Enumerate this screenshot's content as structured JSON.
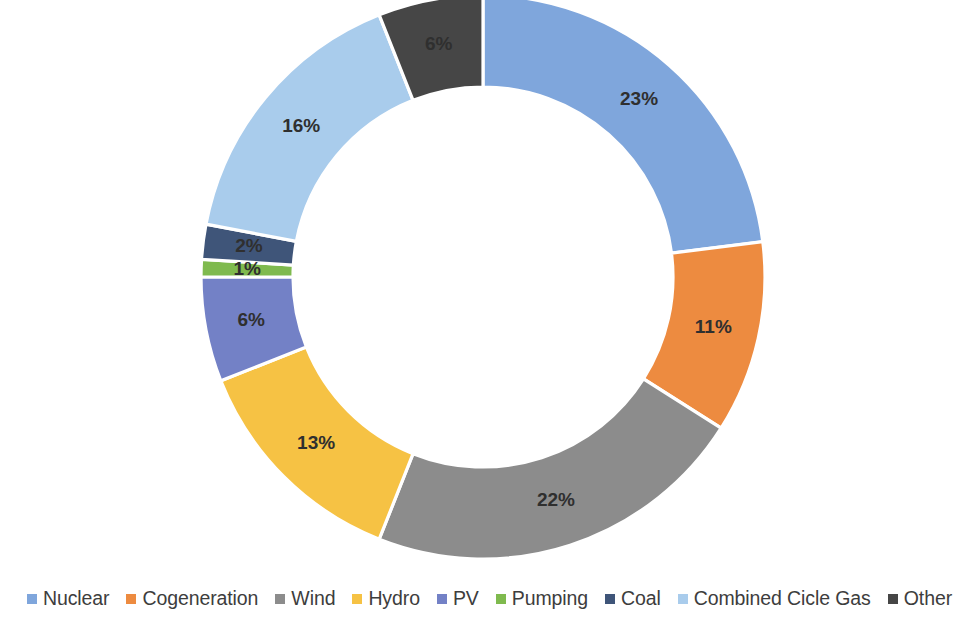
{
  "chart_data": {
    "type": "pie",
    "variant": "donut",
    "title": "",
    "subtitle": "",
    "xlabel": "",
    "ylabel": "",
    "legend_position": "bottom",
    "grid": false,
    "start_angle_deg": 0,
    "direction": "clockwise",
    "value_suffix": "%",
    "categories": [
      "Nuclear",
      "Cogeneration",
      "Wind",
      "Hydro",
      "PV",
      "Pumping",
      "Coal",
      "Combined Cicle Gas",
      "Other"
    ],
    "values": [
      23,
      11,
      22,
      13,
      6,
      1,
      2,
      16,
      6
    ],
    "labels": [
      "23%",
      "11%",
      "22%",
      "13%",
      "6%",
      "1%",
      "2%",
      "16%",
      "6%"
    ],
    "colors": [
      "#7FA6DC",
      "#ED8B40",
      "#8C8C8C",
      "#F6C244",
      "#7381C6",
      "#7FBA4E",
      "#3F5579",
      "#A9CCEC",
      "#464646"
    ],
    "label_text_colors": [
      "#2f2f2f",
      "#2a2a2a",
      "#1f1f1f",
      "#2a2a2a",
      "#1f1f1f",
      "#1f1f1f",
      "#141414",
      "#2a2a2a",
      "#1a1a1a"
    ]
  },
  "legend": {
    "items": [
      {
        "label": "Nuclear",
        "color": "#7FA6DC"
      },
      {
        "label": "Cogeneration",
        "color": "#ED8B40"
      },
      {
        "label": "Wind",
        "color": "#8C8C8C"
      },
      {
        "label": "Hydro",
        "color": "#F6C244"
      },
      {
        "label": "PV",
        "color": "#7381C6"
      },
      {
        "label": "Pumping",
        "color": "#7FBA4E"
      },
      {
        "label": "Coal",
        "color": "#3F5579"
      },
      {
        "label": "Combined Cicle Gas",
        "color": "#A9CCEC"
      },
      {
        "label": "Other",
        "color": "#464646"
      }
    ]
  },
  "geometry": {
    "center_x": 483,
    "center_y": 277,
    "outer_radius": 282,
    "inner_radius": 190,
    "label_radius": 236
  }
}
